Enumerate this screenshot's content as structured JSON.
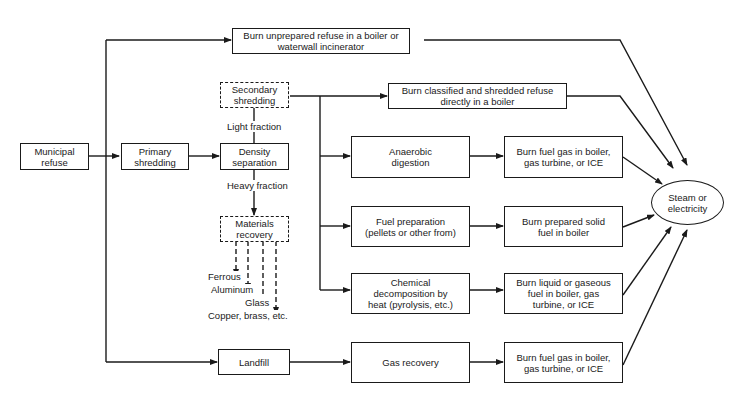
{
  "diagram": {
    "nodes": {
      "municipal_refuse": "Municipal\nrefuse",
      "primary_shredding": "Primary\nshredding",
      "density_separation": "Density\nseparation",
      "secondary_shredding": "Secondary\nshredding",
      "materials_recovery": "Materials\nrecovery",
      "burn_unprepared": "Burn unprepared refuse in a boiler or\nwaterwall incinerator",
      "burn_classified": "Burn classified and shredded refuse\ndirectly in a boiler",
      "anaerobic_digestion": "Anaerobic\ndigestion",
      "fuel_preparation": "Fuel preparation\n(pellets or other from)",
      "chemical_decomposition": "Chemical\ndecomposition by\nheat (pyrolysis, etc.)",
      "landfill": "Landfill",
      "gas_recovery": "Gas recovery",
      "burn_fuel_gas_1": "Burn fuel gas in boiler,\ngas turbine, or ICE",
      "burn_prepared_solid": "Burn prepared solid\nfuel in boiler",
      "burn_liquid_gaseous": "Burn liquid or gaseous\nfuel in boiler, gas\nturbine, or ICE",
      "burn_fuel_gas_2": "Burn fuel gas in boiler,\ngas turbine, or ICE",
      "steam_or_electricity": "Steam or\nelectricity"
    },
    "edge_labels": {
      "light_fraction": "Light fraction",
      "heavy_fraction": "Heavy fraction"
    },
    "recovered_materials": [
      "Ferrous",
      "Aluminum",
      "Glass",
      "Copper, brass, etc."
    ],
    "edges": [
      [
        "municipal_refuse",
        "primary_shredding"
      ],
      [
        "municipal_refuse",
        "burn_unprepared"
      ],
      [
        "municipal_refuse",
        "landfill"
      ],
      [
        "primary_shredding",
        "density_separation"
      ],
      [
        "density_separation",
        "secondary_shredding",
        "light_fraction"
      ],
      [
        "density_separation",
        "materials_recovery",
        "heavy_fraction"
      ],
      [
        "secondary_shredding",
        "burn_classified"
      ],
      [
        "secondary_shredding",
        "anaerobic_digestion"
      ],
      [
        "secondary_shredding",
        "fuel_preparation"
      ],
      [
        "secondary_shredding",
        "chemical_decomposition"
      ],
      [
        "anaerobic_digestion",
        "burn_fuel_gas_1"
      ],
      [
        "fuel_preparation",
        "burn_prepared_solid"
      ],
      [
        "chemical_decomposition",
        "burn_liquid_gaseous"
      ],
      [
        "landfill",
        "gas_recovery"
      ],
      [
        "gas_recovery",
        "burn_fuel_gas_2"
      ],
      [
        "burn_unprepared",
        "steam_or_electricity"
      ],
      [
        "burn_classified",
        "steam_or_electricity"
      ],
      [
        "burn_fuel_gas_1",
        "steam_or_electricity"
      ],
      [
        "burn_prepared_solid",
        "steam_or_electricity"
      ],
      [
        "burn_liquid_gaseous",
        "steam_or_electricity"
      ],
      [
        "burn_fuel_gas_2",
        "steam_or_electricity"
      ]
    ]
  }
}
